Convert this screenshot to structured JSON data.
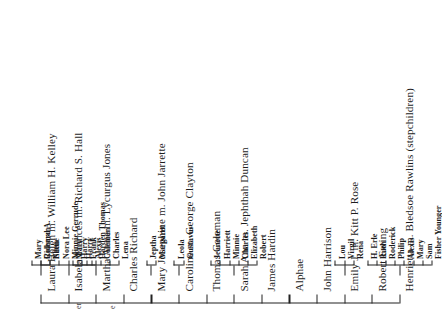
{
  "document": {
    "kind": "genealogical-chart",
    "orientation": "rotated-90-counterclockwise",
    "stray_marks": [
      "er",
      "e"
    ]
  },
  "chart_data": {
    "type": "diagram",
    "title": "",
    "subtitle": "",
    "xlabel": "",
    "ylabel": "",
    "layout": {
      "root_spine": "vertical",
      "reading_direction": "bottom-to-top",
      "rotation_degrees": -90,
      "grid": false,
      "legend": "none"
    },
    "siblings": [
      {
        "index": 0,
        "name": "Laura Helen m. William H. Kelley",
        "has_children": true,
        "children": [
          "Mary",
          "Coleman",
          "Ellen"
        ]
      },
      {
        "index": 1,
        "name": "Isabela Frances m. Richard S. Hall",
        "has_children": true,
        "children": [
          "Richard A.",
          "Nettie",
          "Nora Lee",
          "Minnie Gerrude",
          "Harry",
          "Frank",
          "Harden Thomas"
        ]
      },
      {
        "index": 2,
        "name": "Martha Anne m. Lycurgus Jones",
        "has_children": true,
        "children": [
          "Mary",
          "Harry",
          "Alexis",
          "Coleman",
          "Charles",
          "Lena"
        ]
      },
      {
        "index": 3,
        "name": "Charles Richard",
        "has_children": false,
        "children": []
      },
      {
        "index": 4,
        "name": "Mary Josephine m. John Jarrette",
        "has_children": true,
        "children": [
          "Jeptha",
          "Margaret"
        ]
      },
      {
        "index": 5,
        "name": "Caroline m. George Clayton",
        "has_children": true,
        "children": [
          "Leola",
          "Gustavus"
        ]
      },
      {
        "index": 6,
        "name": "Thomas Coleman",
        "has_children": false,
        "children": []
      },
      {
        "index": 7,
        "name": "Sarah Ann m. Jephthah Duncan",
        "has_children": true,
        "children": [
          "Jeanette",
          "Harriett",
          "Minnie",
          "Charles",
          "Elizabeth",
          "Robert"
        ]
      },
      {
        "index": 8,
        "name": "James Hardin",
        "has_children": false,
        "children": []
      },
      {
        "index": 9,
        "name": "Alphae",
        "has_children": false,
        "children": []
      },
      {
        "index": 10,
        "name": "John Harrison",
        "has_children": false,
        "children": []
      },
      {
        "index": 11,
        "name": "Emily J. m. Kitt P. Rose",
        "has_children": true,
        "children": [
          "Lou",
          "Virgil",
          "Rena"
        ]
      },
      {
        "index": 12,
        "name": "Robert Ewing",
        "has_children": false,
        "children": []
      },
      {
        "index": 13,
        "name": "Henrietta m. Bledsoe Rawlins (stepchildren)",
        "has_children": true,
        "children": [
          "H. Erle",
          "Ruth",
          "Roderick",
          "Philip",
          "Alexis",
          "Mary",
          "Sam",
          "Fisher Younger"
        ]
      }
    ]
  },
  "colors": {
    "ink": "#1d1d1d",
    "line": "#222222",
    "background": "#ffffff"
  }
}
